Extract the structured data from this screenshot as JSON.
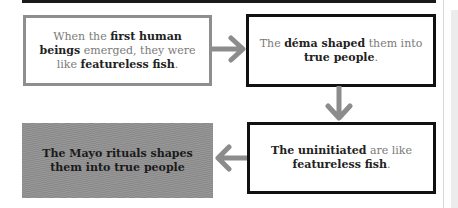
{
  "diagram": {
    "boxes": [
      {
        "id": "box-1",
        "style": "grey-border",
        "segments": [
          {
            "text": "When the ",
            "bold": false
          },
          {
            "text": "first human beings",
            "bold": true
          },
          {
            "text": " emerged, they were like ",
            "bold": false
          },
          {
            "text": "featureless fish",
            "bold": true
          },
          {
            "text": ".",
            "bold": false
          }
        ]
      },
      {
        "id": "box-2",
        "style": "black-border",
        "segments": [
          {
            "text": "The ",
            "bold": false
          },
          {
            "text": "déma shaped",
            "bold": true
          },
          {
            "text": " them into ",
            "bold": false
          },
          {
            "text": "true people",
            "bold": true
          },
          {
            "text": ".",
            "bold": false
          }
        ]
      },
      {
        "id": "box-3",
        "style": "grey-fill",
        "segments": [
          {
            "text": "The Mayo rituals shapes them into true people",
            "bold": true
          }
        ]
      },
      {
        "id": "box-4",
        "style": "black-border",
        "segments": [
          {
            "text": "The uninitiated",
            "bold": true
          },
          {
            "text": " are like ",
            "bold": false
          },
          {
            "text": "featureless fish",
            "bold": true
          },
          {
            "text": ".",
            "bold": false
          }
        ]
      }
    ],
    "arrows": [
      {
        "from": "box-1",
        "to": "box-2",
        "direction": "right"
      },
      {
        "from": "box-2",
        "to": "box-4",
        "direction": "down"
      },
      {
        "from": "box-4",
        "to": "box-3",
        "direction": "left"
      }
    ],
    "colors": {
      "arrow": "#8c8c8c",
      "border_dark": "#111111",
      "border_grey": "#8e8e8e",
      "fill_grey": "#8f8f8f",
      "text_regular": "#7a7a7a",
      "text_bold": "#222222"
    }
  }
}
